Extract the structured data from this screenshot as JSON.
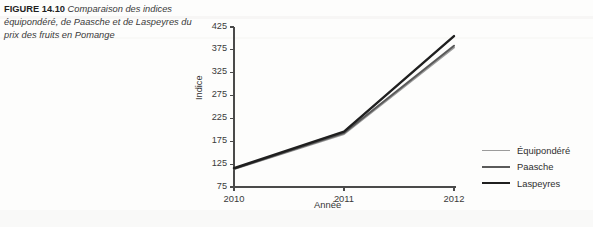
{
  "caption": {
    "figure_number": "FIGURE 14.10",
    "text": "Comparaison des indices équipondéré, de Paasche et de Laspeyres du prix des fruits en Pomange"
  },
  "chart_data": {
    "type": "line",
    "title": "",
    "xlabel": "Année",
    "ylabel": "Indice",
    "categories": [
      "2010",
      "2011",
      "2012"
    ],
    "x": [
      2010,
      2011,
      2012
    ],
    "xlim": [
      2010,
      2012
    ],
    "ylim": [
      75,
      425
    ],
    "yticks": [
      75,
      125,
      175,
      225,
      275,
      325,
      375,
      425
    ],
    "xticks": [
      2010,
      2011,
      2012
    ],
    "grid": false,
    "legend_position": "right",
    "series": [
      {
        "name": "Équipondéré",
        "values": [
          114,
          191,
          380
        ],
        "color": "#9b9b9b",
        "width": 2.0
      },
      {
        "name": "Paasche",
        "values": [
          115,
          193,
          384
        ],
        "color": "#5a5a5a",
        "width": 2.0
      },
      {
        "name": "Laspeyres",
        "values": [
          116,
          196,
          405
        ],
        "color": "#1f1f1f",
        "width": 2.4
      }
    ]
  },
  "axis": {
    "frame_color": "#4a4a4a",
    "tick_color": "#4a4a4a"
  },
  "legend": {
    "items": [
      {
        "label": "Équipondéré",
        "color": "#9b9b9b",
        "width": "1.7px"
      },
      {
        "label": "Paasche",
        "color": "#5a5a5a",
        "width": "2.0px"
      },
      {
        "label": "Laspeyres",
        "color": "#1f1f1f",
        "width": "2.6px"
      }
    ]
  }
}
